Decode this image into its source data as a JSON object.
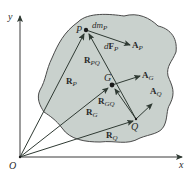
{
  "figure": {
    "type": "rigid-body-kinematics-diagram",
    "colors": {
      "body_fill": "#c9d1cd",
      "body_stroke": "#4a4a4a",
      "vector": "#3a4a40",
      "axis": "#3a3a3a",
      "text": "#2a2a2a"
    },
    "axes": {
      "origin_label": "O",
      "x_label": "x",
      "y_label": "y"
    },
    "points": {
      "P": {
        "label": "P",
        "mass_element": "dm",
        "mass_sub": "P"
      },
      "G": {
        "label": "G"
      },
      "Q": {
        "label": "Q"
      }
    },
    "vectors": {
      "R_P": {
        "main": "R",
        "sub": "P"
      },
      "R_G": {
        "main": "R",
        "sub": "G"
      },
      "R_Q": {
        "main": "R",
        "sub": "Q"
      },
      "R_PQ": {
        "main": "R",
        "sub": "PQ"
      },
      "R_GQ": {
        "main": "R",
        "sub": "GQ"
      },
      "dF_P": {
        "prefix": "d",
        "main": "F",
        "sub": "P"
      },
      "A_P": {
        "main": "A",
        "sub": "P"
      },
      "A_G": {
        "main": "A",
        "sub": "G"
      },
      "A_Q": {
        "main": "A",
        "sub": "Q"
      }
    }
  }
}
